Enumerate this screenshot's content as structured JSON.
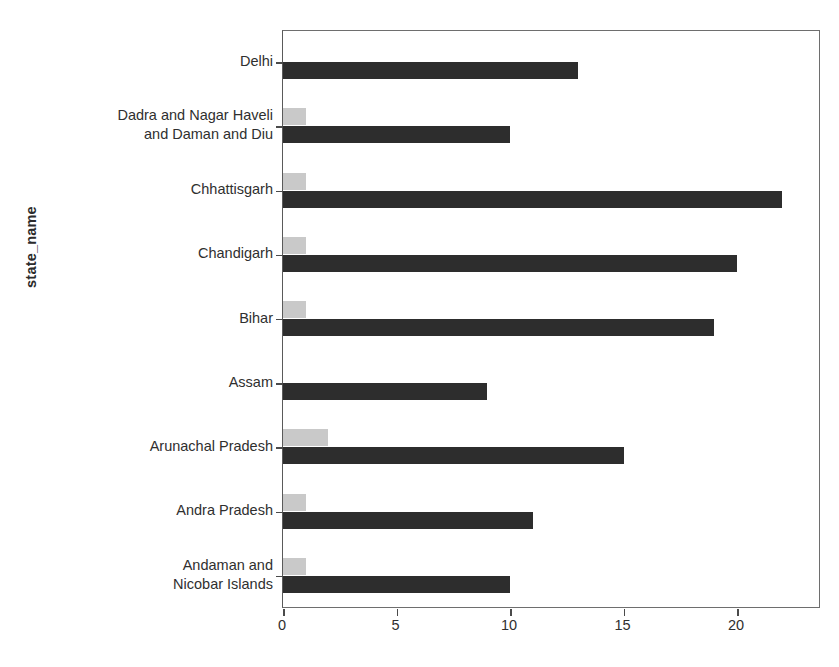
{
  "chart_data": {
    "type": "bar",
    "orientation": "horizontal",
    "title": "",
    "xlabel": "",
    "ylabel": "state_name",
    "xlim": [
      0,
      23.7
    ],
    "ylim": [
      0,
      9
    ],
    "grid": false,
    "xticks": [
      0,
      5,
      10,
      15,
      20
    ],
    "xtick_labels": [
      "0",
      "5",
      "10",
      "15",
      "20"
    ],
    "legend_position": "upper right",
    "categories": [
      "Delhi",
      "Dadra and Nagar Haveli\nand Daman and Diu",
      "Chhattisgarh",
      "Chandigarh",
      "Bihar",
      "Assam",
      "Arunachal Pradesh",
      "Andra Pradesh",
      "Andaman and\nNicobar Islands"
    ],
    "series": [
      {
        "name": "active",
        "color": "#2d2d2d",
        "values": [
          13,
          10,
          22,
          20,
          19,
          9,
          15,
          11,
          10
        ]
      },
      {
        "name": "death",
        "color": "#c9c9c9",
        "values": [
          0,
          1,
          1,
          1,
          1,
          0,
          2,
          1,
          1
        ]
      }
    ]
  },
  "legend": {
    "items": [
      {
        "label": "active",
        "swatch": "active-swatch"
      },
      {
        "label": "death",
        "swatch": "death-swatch"
      }
    ]
  },
  "axes": {
    "ylabel": "state_name"
  }
}
